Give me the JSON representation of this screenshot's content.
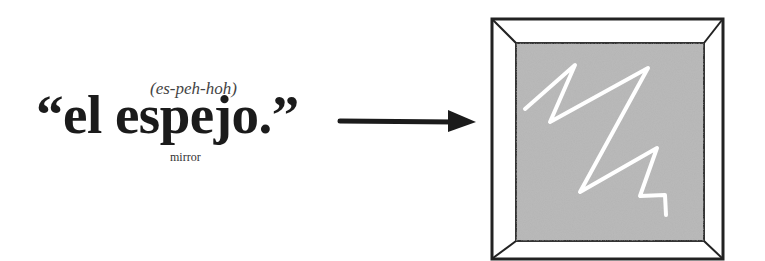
{
  "vocab": {
    "pronunciation": "(es-peh-hoh)",
    "word": "“el espejo.”",
    "translation": "mirror"
  },
  "arrow": {
    "icon": "right-arrow-icon",
    "color": "#1b1b1b"
  },
  "illustration": {
    "icon": "mirror-icon",
    "frame_color": "#ffffff",
    "frame_border_color": "#222222",
    "glass_color": "#b9b9b9",
    "reflection_color": "#ffffff"
  }
}
